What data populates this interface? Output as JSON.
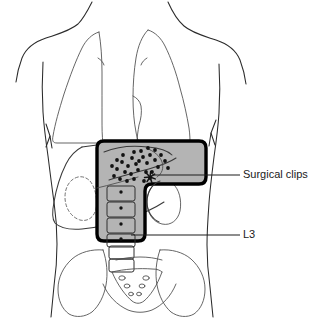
{
  "figure": {
    "kind": "medical-illustration",
    "subtitle_none": "",
    "view": "anterior",
    "background_color": "#ffffff"
  },
  "colors": {
    "field_fill": "#b4b4b4",
    "field_stroke": "#000000",
    "outline_stroke": "#2b2b2b",
    "organ_stroke": "#3a3a3a",
    "clip_color": "#121212",
    "text_color": "#1a1a1a",
    "leader_color": "#1d1d1d"
  },
  "callouts": [
    {
      "id": "surgical-clips",
      "label": "Surgical clips",
      "text_x": 243,
      "text_y": 175,
      "leader": {
        "x1": 152,
        "y1": 175,
        "x2": 240,
        "y2": 175
      }
    },
    {
      "id": "l3",
      "label": "L3",
      "text_x": 243,
      "text_y": 235,
      "leader": {
        "x1": 131,
        "y1": 235,
        "x2": 240,
        "y2": 235
      }
    }
  ],
  "radiation_field": {
    "name": "treatment-field",
    "shape": "boot",
    "fill": "#b4b4b4",
    "stroke_width": 3.4,
    "corner_radius": 7,
    "path": "M 104 141 L 199 141 Q 206 141 206 148 L 206 177 Q 206 184 199 184 L 152 184 Q 145 184 145 191 L 145 234 Q 145 241 138 241 L 104 241 Q 97 241 97 234 L 97 148 Q 97 141 104 141 Z"
  },
  "surgical_clips": {
    "name": "surgical-clip-markers",
    "radius": 1.9,
    "points": [
      [
        117,
        169
      ],
      [
        122,
        162
      ],
      [
        128,
        166
      ],
      [
        125,
        172
      ],
      [
        132,
        158
      ],
      [
        136,
        164
      ],
      [
        131,
        174
      ],
      [
        138,
        170
      ],
      [
        143,
        157
      ],
      [
        147,
        163
      ],
      [
        141,
        151
      ],
      [
        150,
        155
      ],
      [
        114,
        176
      ],
      [
        120,
        179
      ],
      [
        127,
        181
      ],
      [
        134,
        179
      ],
      [
        155,
        160
      ],
      [
        158,
        167
      ],
      [
        152,
        172
      ],
      [
        161,
        155
      ],
      [
        146,
        172
      ],
      [
        150,
        178
      ],
      [
        144,
        181
      ],
      [
        139,
        161
      ],
      [
        123,
        155
      ],
      [
        117,
        160
      ],
      [
        112,
        166
      ],
      [
        155,
        150
      ],
      [
        165,
        161
      ],
      [
        168,
        168
      ],
      [
        148,
        148
      ],
      [
        134,
        152
      ]
    ],
    "cluster_marker": {
      "x": 150,
      "y": 177,
      "spokes": 7,
      "length": 5.5
    }
  },
  "vertebrae": {
    "name": "lumbar-vertebral-bodies",
    "in_field": [
      {
        "x": 107,
        "y": 186,
        "w": 28,
        "h": 15,
        "dot_x": 121,
        "dot_y": 192
      },
      {
        "x": 107,
        "y": 202,
        "w": 28,
        "h": 15,
        "dot_x": 121,
        "dot_y": 208
      },
      {
        "x": 107,
        "y": 218,
        "w": 28,
        "h": 15,
        "dot_x": 121,
        "dot_y": 224
      },
      {
        "x": 107,
        "y": 234,
        "w": 28,
        "h": 13,
        "dot_x": 121,
        "dot_y": 239
      }
    ],
    "below_field": [
      {
        "x": 109,
        "y": 246,
        "w": 25,
        "h": 13
      },
      {
        "x": 109,
        "y": 259,
        "w": 25,
        "h": 13
      }
    ]
  },
  "organs": {
    "liver": {
      "name": "liver-outline"
    },
    "kidney_left": {
      "name": "kidney-left-outline",
      "style": "dashed"
    },
    "kidney_right": {
      "name": "kidney-right-outline",
      "style": "solid"
    },
    "lung_left": {
      "name": "lung-left-outline"
    },
    "lung_right": {
      "name": "lung-right-outline"
    },
    "sacrum": {
      "name": "sacrum-outline"
    },
    "pelvis_left": {
      "name": "iliac-wing-left"
    },
    "pelvis_right": {
      "name": "iliac-wing-right"
    },
    "torso": {
      "name": "torso-outline"
    },
    "diaphragm": {
      "name": "diaphragm-arrows"
    }
  }
}
